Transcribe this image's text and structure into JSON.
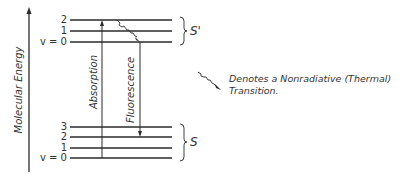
{
  "diagram": {
    "type": "jablonski-energy-level",
    "axis": {
      "label": "Molecular Energy",
      "direction": "up"
    },
    "excited_state": {
      "label": "S'",
      "levels": [
        {
          "label": "2",
          "y": 20
        },
        {
          "label": "1",
          "y": 31
        },
        {
          "label": "v = 0",
          "y": 42
        }
      ]
    },
    "ground_state": {
      "label": "S",
      "levels": [
        {
          "label": "3",
          "y": 127
        },
        {
          "label": "2",
          "y": 137
        },
        {
          "label": "1",
          "y": 148
        },
        {
          "label": "v = 0",
          "y": 158
        }
      ]
    },
    "transitions": [
      {
        "label": "Absorption",
        "from": "S v=0",
        "to": "S' v=2",
        "type": "radiative-up"
      },
      {
        "label": "Fluorescence",
        "from": "S' v=0",
        "to": "S v=2",
        "type": "radiative-down"
      },
      {
        "label": "",
        "from": "S' v=2",
        "to": "S' v=0",
        "type": "nonradiative"
      }
    ],
    "legend": {
      "line1": "Denotes a Nonradiative (Thermal)",
      "line2": "Transition."
    },
    "colors": {
      "line": "#2a2a2a",
      "text": "#333333",
      "background": "#ffffff"
    }
  }
}
